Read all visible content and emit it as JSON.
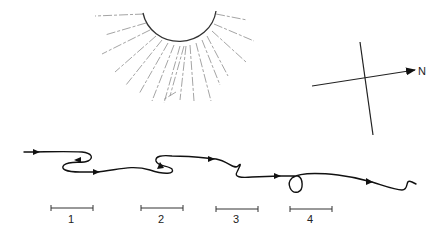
{
  "diagram": {
    "sun": {
      "description": "half sun with dashed rays",
      "center": [
        180,
        10
      ],
      "radius": 35,
      "ray_color": "#9a9a9a",
      "outline_color": "#333333"
    },
    "compass": {
      "north_label": "N",
      "line_color": "#222222"
    },
    "path": {
      "description": "meandering trajectory with direction arrows and two loops",
      "color": "#111111"
    },
    "scale_segments": [
      {
        "label": "1"
      },
      {
        "label": "2"
      },
      {
        "label": "3"
      },
      {
        "label": "4"
      }
    ]
  }
}
